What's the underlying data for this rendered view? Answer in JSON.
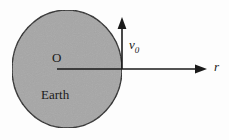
{
  "figure": {
    "background_color": "#fdfdfd",
    "body": {
      "name": "Earth",
      "label": "Earth",
      "center_label": "O",
      "fill_color": "#a6a6a6",
      "stroke_color": "#1f1f1f",
      "center": {
        "x": 67,
        "y": 69
      },
      "radius_x": 55,
      "radius_y": 59
    },
    "axes": [
      {
        "name": "radial-axis",
        "label": "r",
        "italic": true,
        "direction": "right",
        "from": {
          "x": 57,
          "y": 69
        },
        "to": {
          "x": 207,
          "y": 69
        },
        "color": "#1a1a1a"
      },
      {
        "name": "velocity-vector",
        "label": "v",
        "subscript": "0",
        "italic": true,
        "direction": "up",
        "from": {
          "x": 122,
          "y": 69
        },
        "to": {
          "x": 122,
          "y": 17
        },
        "color": "#1a1a1a"
      }
    ],
    "labels": {
      "origin": "O",
      "body_name": "Earth",
      "velocity_base": "v",
      "velocity_sub": "0",
      "radial": "r"
    }
  }
}
